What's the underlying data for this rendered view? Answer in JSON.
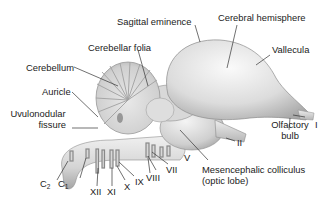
{
  "diagram": {
    "colors": {
      "background": "#ffffff",
      "tissue_light": "#f2f2f2",
      "tissue_mid": "#cfcfcf",
      "tissue_dark": "#9a9a9a",
      "leader_line": "#333333",
      "text": "#222222"
    },
    "labels": {
      "sagittal_eminence": "Sagittal eminence",
      "cerebral_hemisphere": "Cerebral hemisphere",
      "cerebellar_folia": "Cerebellar folia",
      "vallecula": "Vallecula",
      "cerebellum": "Cerebellum",
      "auricle": "Auricle",
      "uvulonodular_line1": "Uvulonodular",
      "uvulonodular_line2": "fissure",
      "olfactory_line1": "Olfactory",
      "olfactory_line2": "bulb",
      "nerve_I": "I",
      "nerve_II": "II",
      "nerve_V": "V",
      "nerve_VII": "VII",
      "nerve_VIII": "VIII",
      "nerve_IX": "IX",
      "nerve_X": "X",
      "nerve_XI": "XI",
      "nerve_XII": "XII",
      "c2_base": "C",
      "c2_sub": "2",
      "c1_base": "C",
      "c1_sub": "1",
      "mesencephalic_line1": "Mesencephalic colliculus",
      "mesencephalic_line2": "(optic lobe)"
    }
  }
}
